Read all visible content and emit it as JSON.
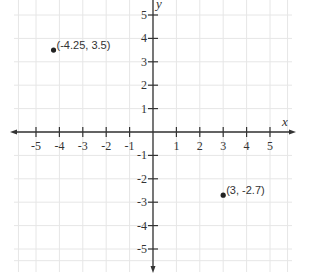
{
  "chart_data": {
    "type": "scatter",
    "title": "",
    "xlabel": "x",
    "ylabel": "y",
    "xlim": [
      -6,
      6
    ],
    "ylim": [
      -6,
      6
    ],
    "grid": true,
    "x_ticks": [
      -5,
      -4,
      -3,
      -2,
      -1,
      1,
      2,
      3,
      4,
      5
    ],
    "y_ticks": [
      5,
      4,
      3,
      2,
      1,
      -1,
      -2,
      -3,
      -4,
      -5
    ],
    "series": [
      {
        "name": "points",
        "points": [
          {
            "x": -4.25,
            "y": 3.5,
            "label": "(-4.25, 3.5)"
          },
          {
            "x": 3,
            "y": -2.7,
            "label": "(3, -2.7)"
          }
        ]
      }
    ]
  },
  "colors": {
    "axis": "#333333",
    "grid": "#e6e6e6",
    "point": "#222222"
  }
}
